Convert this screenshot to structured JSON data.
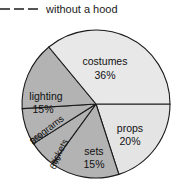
{
  "legend": {
    "marker": "dashed-line-icon",
    "label": "without a hood"
  },
  "chart_data": {
    "type": "pie",
    "title": "",
    "start_angle_deg": 0,
    "direction": "clockwise",
    "legend_position": "top-left",
    "grid": false,
    "total": 100,
    "unit": "%",
    "categories": [
      "props",
      "sets",
      "tickets",
      "programs",
      "lighting",
      "costumes"
    ],
    "values": [
      20,
      15,
      6,
      8,
      15,
      36
    ],
    "colors": [
      "#e4e4e4",
      "#b3b3b3",
      "#b3b3b3",
      "#b3b3b3",
      "#b3b3b3",
      "#e8e8e8"
    ],
    "slices": [
      {
        "name": "props",
        "label": "props",
        "value_label": "20%",
        "value": 20,
        "color": "#e4e4e4",
        "rotated": false,
        "label_x": 130,
        "label_y": 129,
        "value_x": 130,
        "value_y": 142,
        "rotation": 0
      },
      {
        "name": "sets",
        "label": "sets",
        "value_label": "15%",
        "value": 15,
        "color": "#b3b3b3",
        "rotated": false,
        "label_x": 94,
        "label_y": 152,
        "value_x": 94,
        "value_y": 165,
        "rotation": 0
      },
      {
        "name": "tickets",
        "label": "tickets",
        "value_label": "6%",
        "value": 6,
        "color": "#b3b3b3",
        "rotated": true,
        "label_x": 60,
        "label_y": 152,
        "value_x": 56,
        "value_y": 163,
        "rotation": 62
      },
      {
        "name": "programs",
        "label": "programs",
        "value_label": "8%",
        "value": 8,
        "color": "#b3b3b3",
        "rotated": true,
        "label_x": 47,
        "label_y": 130,
        "value_x": 37,
        "value_y": 139,
        "rotation": 37
      },
      {
        "name": "lighting",
        "label": "lighting",
        "value_label": "15%",
        "value": 15,
        "color": "#b3b3b3",
        "rotated": false,
        "label_x": 46,
        "label_y": 97,
        "value_x": 43,
        "value_y": 110,
        "rotation": 0
      },
      {
        "name": "costumes",
        "label": "costumes",
        "value_label": "36%",
        "value": 36,
        "color": "#e8e8e8",
        "rotated": false,
        "label_x": 105,
        "label_y": 62,
        "value_x": 105,
        "value_y": 76,
        "rotation": 0
      }
    ],
    "geometry": {
      "center_x": 96,
      "center_y": 104,
      "radius": 74
    }
  }
}
